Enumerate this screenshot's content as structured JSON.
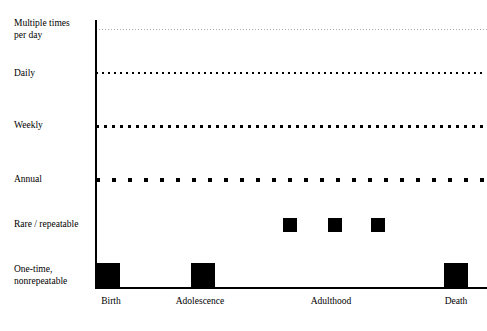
{
  "chart_data": {
    "type": "scatter",
    "title": "",
    "subtitle": "",
    "xlabel": "",
    "ylabel": "",
    "grid": false,
    "legend_position": "none",
    "plot_area": {
      "left_px": 96,
      "right_px": 487,
      "top_px": 20,
      "bottom_px": 288
    },
    "x_axis": {
      "type": "categorical-timeline",
      "categories": [
        "Birth",
        "Adolescence",
        "Adulthood",
        "Death"
      ],
      "tick_positions_px": [
        111,
        200,
        331,
        456
      ],
      "tick_labels": [
        "Birth",
        "Adolescence",
        "Adulthood",
        "Death"
      ]
    },
    "y_axis": {
      "type": "categorical-ordinal",
      "direction": "high-frequency-top",
      "categories": [
        "Multiple times\nper day",
        "Daily",
        "Weekly",
        "Annual",
        "Rare / repeatable",
        "One-time,\nnonrepeatable"
      ],
      "tick_positions_px": [
        29,
        73,
        126,
        180,
        225,
        275
      ]
    },
    "series": [
      {
        "name": "Multiple times per day",
        "render": "dotted-line",
        "y_px": 29,
        "dot_size_px": 1,
        "dot_gap_px": 2,
        "color": "#aaaaaa",
        "x_start_px": 96,
        "x_end_px": 487,
        "values": "continuous across entire lifespan"
      },
      {
        "name": "Daily",
        "render": "dotted-line",
        "y_px": 73,
        "dot_size_px": 2,
        "dot_gap_px": 4,
        "color": "#000000",
        "x_start_px": 96,
        "x_end_px": 487,
        "values": "continuous across entire lifespan"
      },
      {
        "name": "Weekly",
        "render": "dotted-line",
        "y_px": 126,
        "dot_size_px": 3,
        "dot_gap_px": 5,
        "color": "#000000",
        "x_start_px": 96,
        "x_end_px": 487,
        "values": "continuous across entire lifespan"
      },
      {
        "name": "Annual",
        "render": "dotted-line",
        "y_px": 180,
        "dot_size_px": 4,
        "dot_gap_px": 12,
        "color": "#000000",
        "x_start_px": 96,
        "x_end_px": 487,
        "values": "continuous across entire lifespan"
      },
      {
        "name": "Rare / repeatable",
        "render": "square-markers",
        "y_px": 225,
        "marker_size_px": 14,
        "color": "#000000",
        "x_positions_px": [
          283,
          328,
          371
        ],
        "count": 3,
        "region": "Adulthood"
      },
      {
        "name": "One-time, nonrepeatable",
        "render": "square-markers",
        "y_px": 275,
        "marker_size_px": 24,
        "color": "#000000",
        "x_positions_px": [
          96,
          191,
          444
        ],
        "count": 3,
        "region": "Birth, Adolescence, Death"
      }
    ]
  },
  "y_axis_labels": [
    {
      "text": "Multiple times\nper day",
      "top_px": 18
    },
    {
      "text": "Daily",
      "top_px": 68
    },
    {
      "text": "Weekly",
      "top_px": 120
    },
    {
      "text": "Annual",
      "top_px": 174
    },
    {
      "text": "Rare / repeatable",
      "top_px": 219
    },
    {
      "text": "One-time,\nnonrepeatable",
      "top_px": 264
    }
  ],
  "x_axis_labels": [
    {
      "text": "Birth",
      "left_px": 111
    },
    {
      "text": "Adolescence",
      "left_px": 200
    },
    {
      "text": "Adulthood",
      "left_px": 331
    },
    {
      "text": "Death",
      "left_px": 456
    }
  ],
  "colors": {
    "axis": "#000000",
    "marker": "#000000",
    "faint_dot": "#aaaaaa",
    "background": "#ffffff"
  }
}
